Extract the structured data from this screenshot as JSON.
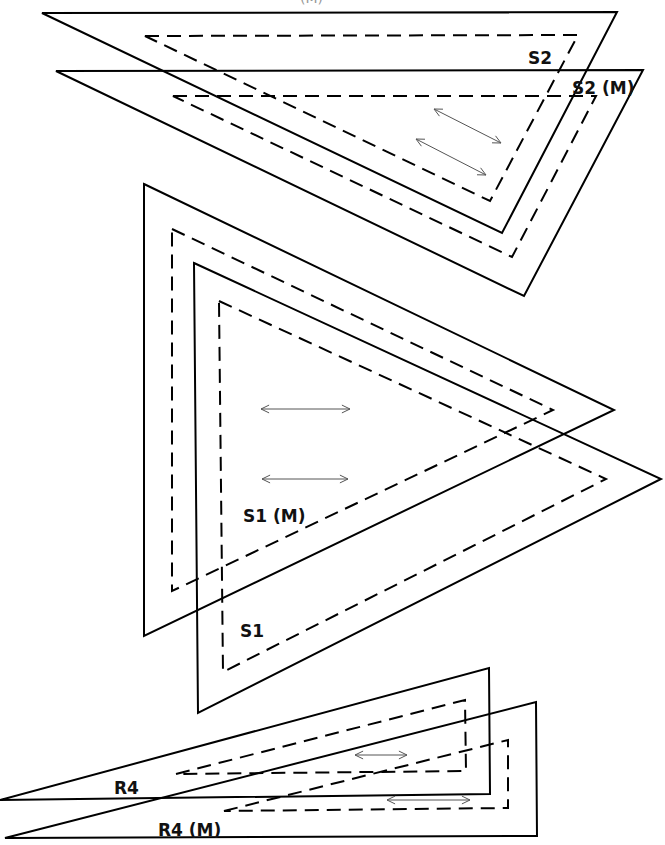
{
  "diagram": {
    "colors": {
      "line": "#000000",
      "grain": "#555555",
      "background": "#ffffff"
    },
    "pieces": [
      {
        "id": "S2",
        "label": "S2",
        "label_pos": [
          528,
          50
        ],
        "outer": [
          [
            42,
            13
          ],
          [
            617,
            12
          ],
          [
            502,
            233
          ]
        ],
        "seam": [
          [
            145,
            36
          ],
          [
            578,
            35
          ],
          [
            490,
            201
          ]
        ],
        "grain_arrows": [
          [
            [
              434,
              109
            ],
            [
              501,
              143
            ]
          ],
          [
            [
              416,
              139
            ],
            [
              486,
              175
            ]
          ]
        ]
      },
      {
        "id": "S2M",
        "label": "S2 (M)",
        "label_pos": [
          572,
          80
        ],
        "outer": [
          [
            56,
            71
          ],
          [
            643,
            70
          ],
          [
            524,
            296
          ]
        ],
        "seam": [
          [
            173,
            96
          ],
          [
            596,
            96
          ],
          [
            512,
            257
          ]
        ],
        "grain_arrows": []
      },
      {
        "id": "S1M",
        "label": "S1 (M)",
        "label_pos": [
          243,
          508
        ],
        "outer": [
          [
            144,
            184
          ],
          [
            614,
            410
          ],
          [
            144,
            636
          ]
        ],
        "seam": [
          [
            172,
            229
          ],
          [
            553,
            410
          ],
          [
            172,
            591
          ]
        ],
        "grain_arrows": [
          [
            [
              261,
              409
            ],
            [
              350,
              409
            ]
          ],
          [
            [
              262,
              479
            ],
            [
              348,
              479
            ]
          ]
        ]
      },
      {
        "id": "S1",
        "label": "S1",
        "label_pos": [
          240,
          623
        ],
        "outer": [
          [
            194,
            263
          ],
          [
            661,
            479
          ],
          [
            198,
            713
          ]
        ],
        "seam": [
          [
            219,
            301
          ],
          [
            606,
            479
          ],
          [
            223,
            672
          ]
        ],
        "grain_arrows": []
      },
      {
        "id": "R4",
        "label": "R4",
        "label_pos": [
          114,
          780
        ],
        "outer": [
          [
            0,
            800
          ],
          [
            489,
            668
          ],
          [
            490,
            794
          ]
        ],
        "seam": [
          [
            176,
            774
          ],
          [
            465,
            700
          ],
          [
            466,
            771
          ]
        ],
        "grain_arrows": [
          [
            [
              355,
              755
            ],
            [
              407,
              755
            ]
          ]
        ]
      },
      {
        "id": "R4M",
        "label": "R4 (M)",
        "label_pos": [
          158,
          822
        ],
        "outer": [
          [
            5,
            838
          ],
          [
            536,
            702
          ],
          [
            537,
            836
          ]
        ],
        "seam": [
          [
            224,
            811
          ],
          [
            508,
            740
          ],
          [
            508,
            808
          ]
        ],
        "grain_arrows": [
          [
            [
              387,
              800
            ],
            [
              470,
              800
            ]
          ]
        ]
      }
    ],
    "cutoff_text": "(M)"
  }
}
